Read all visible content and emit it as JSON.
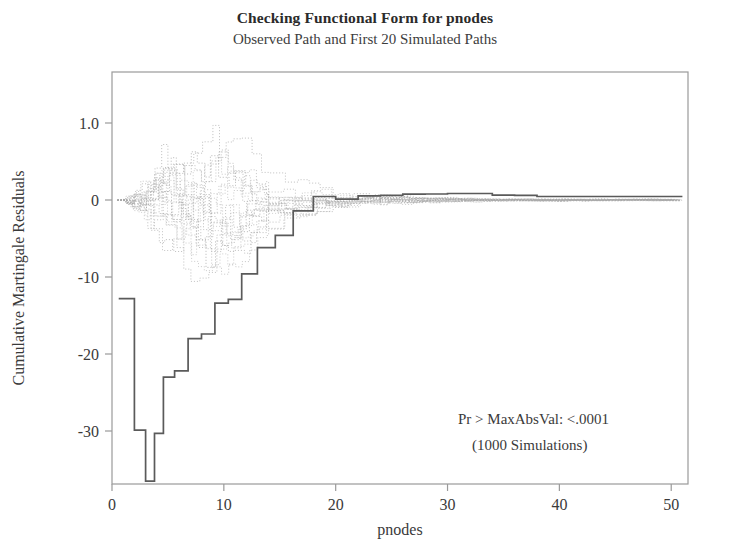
{
  "chart_data": {
    "type": "line",
    "title": "Checking Functional Form for pnodes",
    "subtitle": "Observed Path and First 20 Simulated Paths",
    "xlabel": "pnodes",
    "ylabel": "Cumulative Martingale Residuals",
    "xlim": [
      0,
      51.5
    ],
    "ylim": [
      -38,
      4.5
    ],
    "grid": false,
    "legend": null,
    "xticks": [
      0,
      10,
      20,
      30,
      40,
      50
    ],
    "xtick_labels": [
      "0",
      "10",
      "20",
      "30",
      "40",
      "50"
    ],
    "yticks": [
      1.0,
      0,
      -10,
      -20,
      -30
    ],
    "ytick_labels": [
      "1.0",
      "0",
      "-10",
      "-20",
      "-30"
    ],
    "annotations": [
      "Pr > MaxAbsVal: <.0001",
      "(1000 Simulations)"
    ],
    "observed_color": "#5a5a5a",
    "simulated_color": "#a8a8a8",
    "axis_color": "#9a9a9a",
    "series": [
      {
        "name": "Observed Path",
        "style": "step-solid",
        "color": "#5a5a5a",
        "x": [
          0.6,
          1.0,
          1.6,
          2.0,
          2.5,
          3.0,
          3.4,
          3.8,
          4.2,
          4.6,
          5.0,
          5.6,
          6.2,
          6.8,
          7.4,
          8.0,
          8.6,
          9.2,
          9.8,
          10.4,
          11.0,
          11.6,
          12.2,
          13.0,
          13.8,
          14.6,
          15.4,
          16.2,
          17.0,
          18.0,
          19.0,
          20.0,
          21.0,
          22.0,
          23.0,
          24.0,
          25.0,
          26.0,
          27.0,
          28.0,
          29.0,
          30.0,
          31.0,
          32.0,
          33.0,
          34.0,
          35.0,
          36.0,
          37.0,
          38.0,
          39.0,
          43.0,
          47.0,
          51.0
        ],
        "y": [
          -12.8,
          -12.8,
          -12.8,
          -29.9,
          -29.9,
          -36.5,
          -36.5,
          -30.3,
          -30.3,
          -23.0,
          -23.0,
          -22.2,
          -22.2,
          -18.0,
          -18.0,
          -17.4,
          -17.4,
          -13.4,
          -13.4,
          -12.9,
          -12.9,
          -9.6,
          -9.6,
          -6.2,
          -6.2,
          -4.6,
          -4.6,
          -1.4,
          -1.4,
          0.45,
          0.45,
          0.1,
          0.1,
          0.55,
          0.55,
          0.6,
          0.6,
          0.75,
          0.75,
          0.78,
          0.78,
          0.85,
          0.85,
          0.85,
          0.85,
          0.62,
          0.62,
          0.6,
          0.6,
          0.45,
          0.45,
          0.45,
          0.45,
          0.45
        ]
      },
      {
        "name": "Simulated Paths",
        "style": "step-dotted",
        "color": "#a8a8a8",
        "count": 20,
        "description": "20 light-gray dotted step paths starting near 0, fanning out to roughly +3 / -13 between pnodes 2 and 12, narrowing through pnodes 12-35, and converging tightly around 0 from pnodes 35 to 51."
      }
    ]
  }
}
